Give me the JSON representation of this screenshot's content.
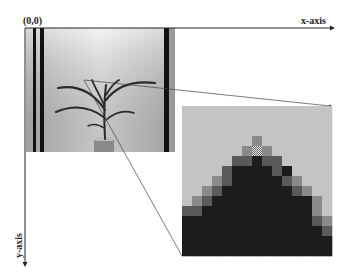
{
  "labels": {
    "origin": "(0,0)",
    "x_axis": "x-axis",
    "y_axis": "y-axis"
  },
  "colors": {
    "axis": "#222222",
    "photo_background": "#d9d9d9",
    "panel_background": "#c4c4c4",
    "plant": "#2a2a2a",
    "pole": "#111111"
  },
  "zoom_grid": {
    "columns": 15,
    "rows": 15,
    "shades": [
      "ccccccccccccccc",
      "ccccccccccccccc",
      "ccccccccccccccc",
      "cccccccmccccccc",
      "ccccccmXmcccccc",
      "ccccclldllccccc",
      "cccclddddldcccc",
      "cccmldddddlmccc",
      "ccmldddddddlmcc",
      "cmlddddddddddmc",
      "lldddddddddddmc",
      "dddddddddddddlm",
      "ddddddddddddddl",
      "dddddddddddddddl",
      "ddddddddddddddd"
    ]
  }
}
